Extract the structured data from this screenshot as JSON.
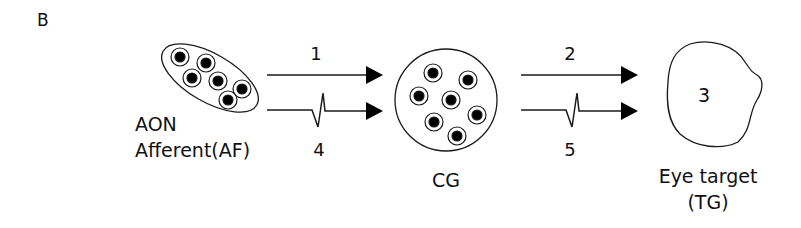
{
  "panel_label": "B",
  "nodes": {
    "aon": {
      "label_line1": "AON",
      "label_line2": "Afferent(AF)",
      "cell_count": 6
    },
    "cg": {
      "label": "CG",
      "cell_count": 7
    },
    "target": {
      "number": "3",
      "label_line1": "Eye target",
      "label_line2": "(TG)"
    }
  },
  "connections": [
    {
      "id": "1",
      "from": "AON",
      "to": "CG",
      "type": "straight-arrow"
    },
    {
      "id": "4",
      "from": "AON",
      "to": "CG",
      "type": "spike-arrow"
    },
    {
      "id": "2",
      "from": "CG",
      "to": "Eye target",
      "type": "straight-arrow"
    },
    {
      "id": "5",
      "from": "CG",
      "to": "Eye target",
      "type": "spike-arrow"
    }
  ],
  "colors": {
    "stroke": "#1a1a1a",
    "fill": "#000000",
    "background": "#ffffff"
  }
}
